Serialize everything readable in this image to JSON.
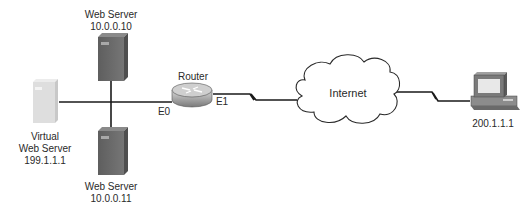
{
  "diagram": {
    "nodes": {
      "web_server_1": {
        "label": "Web Server",
        "ip": "10.0.0.10"
      },
      "web_server_2": {
        "label": "Web Server",
        "ip": "10.0.0.11"
      },
      "virtual_server": {
        "label_line1": "Virtual",
        "label_line2": "Web Server",
        "ip": "199.1.1.1"
      },
      "router": {
        "label": "Router",
        "iface_e0": "E0",
        "iface_e1": "E1"
      },
      "internet": {
        "label": "Internet"
      },
      "client_pc": {
        "ip": "200.1.1.1"
      }
    },
    "colors": {
      "server_dark": "#6e6e6e",
      "server_light": "#dcdcdc",
      "line": "#1a1a1a",
      "router": "#9a9a9a"
    }
  }
}
